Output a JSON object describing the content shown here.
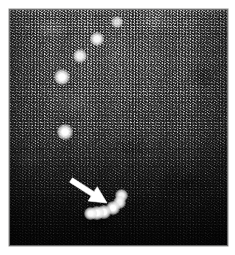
{
  "figure": {
    "domain": "medical-ultrasound-bmode",
    "caption": "",
    "title": "",
    "modality_label": "",
    "background_color": "#ffffff",
    "frame": {
      "x": 9,
      "y": 9,
      "width": 219,
      "height": 237,
      "border_color": "#787878",
      "fill_dark": "#141414",
      "fill_mid": "#525252",
      "fill_light": "#8d8d8d"
    }
  },
  "speckle": {
    "description": "acoustic speckle noise field",
    "near_field_brightness": 0.72,
    "far_field_brightness": 0.12
  },
  "chart_data": {
    "type": "scatter",
    "title": "",
    "xlabel": "",
    "ylabel": "",
    "xlim": [
      0,
      219
    ],
    "ylim": [
      0,
      237
    ],
    "grid": false,
    "legend": "none",
    "series": [
      {
        "name": "upper-point-targets",
        "marker": "bright-spot",
        "color": "#ffffff",
        "points": [
          {
            "x": 108,
            "y": 13,
            "r": 2.2,
            "intensity": 0.78
          },
          {
            "x": 88,
            "y": 30,
            "r": 2.8,
            "intensity": 0.96
          },
          {
            "x": 71,
            "y": 47,
            "r": 2.6,
            "intensity": 0.92
          },
          {
            "x": 53,
            "y": 68,
            "r": 3.0,
            "intensity": 1.0
          },
          {
            "x": 56,
            "y": 123,
            "r": 3.1,
            "intensity": 1.0
          }
        ]
      },
      {
        "name": "lower-arc-targets",
        "marker": "bright-spot",
        "color": "#ffffff",
        "points": [
          {
            "x": 112,
            "y": 186,
            "r": 2.5,
            "intensity": 0.95
          },
          {
            "x": 110,
            "y": 193,
            "r": 2.5,
            "intensity": 0.95
          },
          {
            "x": 104,
            "y": 199,
            "r": 2.8,
            "intensity": 1.0
          },
          {
            "x": 95,
            "y": 203,
            "r": 2.6,
            "intensity": 1.0
          },
          {
            "x": 88,
            "y": 204,
            "r": 2.6,
            "intensity": 1.0
          },
          {
            "x": 81,
            "y": 204,
            "r": 2.5,
            "intensity": 0.98
          }
        ]
      }
    ],
    "annotations": [
      {
        "type": "arrow",
        "color": "#ffffff",
        "tail_x": 62,
        "tail_y": 171,
        "tip_x": 98,
        "tip_y": 194,
        "points_to": "lower-arc-targets"
      }
    ]
  },
  "accessibility": {
    "alt_text": "Grayscale B-mode ultrasound speckle image with bright point reflectors; a white arrow points to a curved row of bright dots in the lower left of field."
  }
}
